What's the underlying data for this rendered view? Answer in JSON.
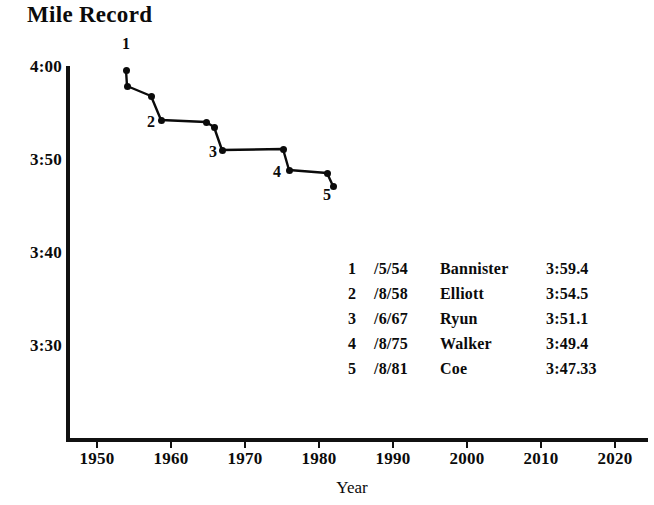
{
  "chart_data": {
    "type": "line",
    "title": "Mile Record",
    "xlabel": "Year",
    "ylabel": "",
    "grid": false,
    "legend_position": "inside-lower-right",
    "xlim": [
      1945,
      2025
    ],
    "ylim_seconds": [
      205,
      245
    ],
    "ylim_labels": [
      "3:25",
      "4:05"
    ],
    "x_ticks": [
      1950,
      1960,
      1970,
      1980,
      1990,
      2000,
      2010,
      2020
    ],
    "x_tick_labels": [
      "1950",
      "1960",
      "1970",
      "1980",
      "1990",
      "2000",
      "2010",
      "2020"
    ],
    "y_ticks_seconds": [
      240,
      230,
      220,
      210
    ],
    "y_tick_labels": [
      "4:00",
      "3:50",
      "3:40",
      "3:30"
    ],
    "series": [
      {
        "name": "World mile record",
        "x": [
          1954.3,
          1954.6,
          1957.6,
          1958.6,
          1964.8,
          1965.6,
          1966.8,
          1975.6,
          1979.6,
          1981.3,
          1981.6
        ],
        "y_labels": [
          "3:59.4",
          "3:58.0",
          "3:57.2",
          "3:54.5",
          "3:54.1",
          "3:53.6",
          "3:51.1",
          "3:51.0",
          "3:49.4",
          "3:48.8",
          "3:47.33"
        ],
        "y_seconds": [
          239.4,
          238.0,
          237.2,
          234.5,
          234.1,
          233.6,
          231.1,
          231.0,
          229.4,
          228.8,
          227.33
        ]
      }
    ],
    "annotations": [
      {
        "label": "1",
        "x": 1954.3,
        "y_seconds": 239.4
      },
      {
        "label": "2",
        "x": 1958.6,
        "y_seconds": 234.5
      },
      {
        "label": "3",
        "x": 1966.8,
        "y_seconds": 231.1
      },
      {
        "label": "4",
        "x": 1975.6,
        "y_seconds": 229.4
      },
      {
        "label": "5",
        "x": 1981.6,
        "y_seconds": 227.33
      }
    ],
    "legend_rows": [
      {
        "index": "1",
        "date": "/5/54",
        "athlete": "Bannister",
        "time": "3:59.4"
      },
      {
        "index": "2",
        "date": "/8/58",
        "athlete": "Elliott",
        "time": "3:54.5"
      },
      {
        "index": "3",
        "date": "/6/67",
        "athlete": "Ryun",
        "time": "3:51.1"
      },
      {
        "index": "4",
        "date": "/8/75",
        "athlete": "Walker",
        "time": "3:49.4"
      },
      {
        "index": "5",
        "date": "/8/81",
        "athlete": "Coe",
        "time": "3:47.33"
      }
    ],
    "colors": {
      "ink": "#0b0b0b",
      "background": "#ffffff"
    }
  },
  "geometry": {
    "y_tick_px": [
      68,
      161,
      254,
      347
    ],
    "x_tick_px": [
      97,
      171,
      245,
      319,
      393,
      467,
      541,
      615
    ],
    "points_px": [
      {
        "x": 126,
        "y": 70
      },
      {
        "x": 127,
        "y": 86
      },
      {
        "x": 151,
        "y": 96
      },
      {
        "x": 161,
        "y": 120
      },
      {
        "x": 206,
        "y": 122
      },
      {
        "x": 214,
        "y": 127
      },
      {
        "x": 222,
        "y": 150
      },
      {
        "x": 283,
        "y": 149
      },
      {
        "x": 289,
        "y": 170
      },
      {
        "x": 327,
        "y": 173
      },
      {
        "x": 333,
        "y": 186
      }
    ],
    "annotation_px": [
      {
        "label": "1",
        "x": 126,
        "y": 44
      },
      {
        "label": "2",
        "x": 151,
        "y": 122
      },
      {
        "label": "3",
        "x": 213,
        "y": 152
      },
      {
        "label": "4",
        "x": 277,
        "y": 172
      },
      {
        "label": "5",
        "x": 327,
        "y": 195
      }
    ]
  }
}
